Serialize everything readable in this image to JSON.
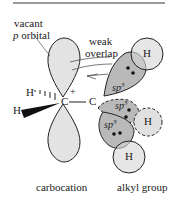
{
  "labels": {
    "vacant_line1": "vacant",
    "vacant_p": "p",
    "vacant_line2": " orbital",
    "weak": "weak",
    "overlap": "overlap",
    "h_top": "H",
    "h_left_upper": "H",
    "h_left_lower": "H",
    "carbon_cation": "C",
    "plus": "+",
    "carbon_alkyl": "C",
    "sp3_1": "sp",
    "sp3_2": "sp",
    "sp3_3": "sp",
    "sup3": "3",
    "h_right": "H",
    "h_bottom": "H",
    "caption_left": "carbocation",
    "caption_right": "alkyl group"
  },
  "colors": {
    "orbital_fill": "#e3e3e3",
    "sp3_fill": "#b9b9b9",
    "h_fill": "#d6d6d6",
    "stroke": "#222222",
    "rule": "#9a9a9a"
  }
}
